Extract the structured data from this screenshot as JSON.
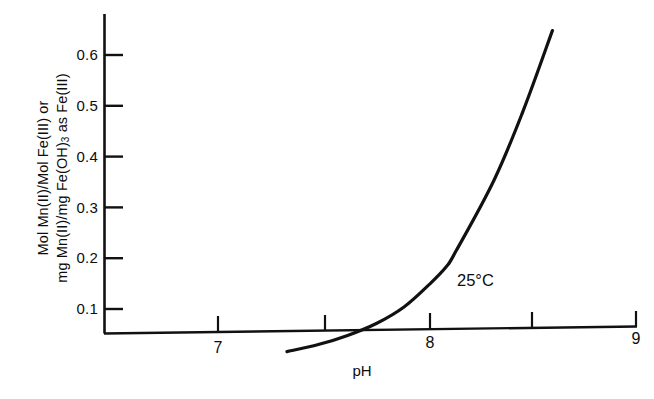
{
  "chart_data": {
    "type": "line",
    "title": "",
    "subtitle": "",
    "xlabel": "pH",
    "ylabel_line1": "Mol Mn(II)/Mol Fe(III) or",
    "ylabel_line2_pre": "mg Mn(II)/mg Fe(OH)",
    "ylabel_line2_sub": "3",
    "ylabel_line2_post": " as Fe(III)",
    "ylabel_plain": "Mol Mn(II)/Mol Fe(III) or mg Mn(II)/mg Fe(OH)3 as Fe(III)",
    "annotations": [
      {
        "text": "25°C",
        "x": 8.22,
        "y": 0.155
      }
    ],
    "xlim": [
      6.46,
      9.0
    ],
    "ylim": [
      0.0,
      0.665
    ],
    "xticks": [
      7,
      8,
      9
    ],
    "xtick_labels": [
      "7",
      "8",
      "9"
    ],
    "xticks_minor": [
      7.5,
      8.5
    ],
    "yticks": [
      0.1,
      0.2,
      0.3,
      0.4,
      0.5,
      0.6
    ],
    "ytick_labels": [
      "0.1",
      "0.2",
      "0.3",
      "0.4",
      "0.5",
      "0.6"
    ],
    "grid": false,
    "legend": null,
    "legend_position": "none",
    "line_color": "#111111",
    "line_width": 3.2,
    "series": [
      {
        "name": "Mn(II) removal vs pH at 25 C",
        "x": [
          7.33,
          7.48,
          7.62,
          7.76,
          7.89,
          8.01,
          8.09,
          8.14,
          8.32,
          8.46,
          8.6
        ],
        "y": [
          0.016,
          0.03,
          0.048,
          0.072,
          0.104,
          0.148,
          0.182,
          0.215,
          0.353,
          0.49,
          0.648
        ]
      }
    ]
  },
  "axes": {
    "y_axis_name": "y-axis-line",
    "x_axis_name": "x-axis-line"
  }
}
